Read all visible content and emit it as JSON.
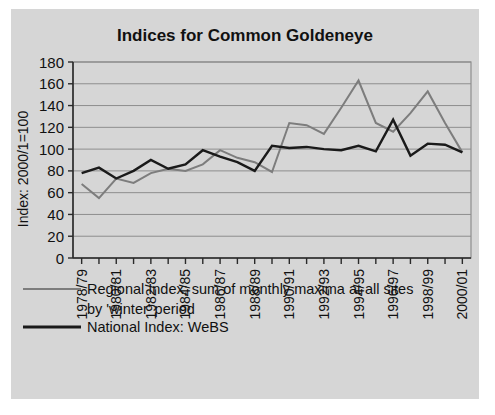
{
  "figure": {
    "background_color": "#d6d6d6",
    "page_background_color": "#ffffff"
  },
  "chart_data": {
    "type": "line",
    "title": "Indices for Common Goldeneye",
    "xlabel": "",
    "ylabel": "Index: 2000/1=100",
    "ylim": [
      0,
      180
    ],
    "ytick_step": 20,
    "yticks": [
      0,
      20,
      40,
      60,
      80,
      100,
      120,
      140,
      160,
      180
    ],
    "grid": true,
    "legend_position": "below",
    "x": [
      "1978/79",
      "1979/80",
      "1980/81",
      "1981/82",
      "1982/83",
      "1983/84",
      "1984/85",
      "1985/86",
      "1986/87",
      "1987/88",
      "1988/89",
      "1989/90",
      "1990/91",
      "1991/92",
      "1992/93",
      "1993/94",
      "1994/95",
      "1995/96",
      "1996/97",
      "1997/98",
      "1998/99",
      "1999/00",
      "2000/01"
    ],
    "xtick_labels_shown": [
      "1978/79",
      "1980/81",
      "1982/83",
      "1984/85",
      "1986/87",
      "1988/89",
      "1990/91",
      "1992/93",
      "1994/95",
      "1996/97",
      "1998/99",
      "2000/01"
    ],
    "series": [
      {
        "name": "Regional Index; sum of monthly maxima at all sites by 'winter' period",
        "color": "#7d7d7d",
        "values": [
          68,
          55,
          73,
          69,
          78,
          82,
          80,
          86,
          99,
          92,
          88,
          79,
          124,
          122,
          114,
          138,
          163,
          124,
          116,
          133,
          153,
          124,
          97
        ]
      },
      {
        "name": "National Index: WeBS",
        "color": "#1a1a1a",
        "values": [
          78,
          83,
          73,
          80,
          90,
          82,
          86,
          99,
          93,
          88,
          80,
          103,
          101,
          102,
          100,
          99,
          103,
          98,
          127,
          94,
          105,
          104,
          97
        ]
      }
    ]
  },
  "legend": {
    "entries": [
      {
        "swatch": "regional-line-swatch",
        "line1": "Regional Index; sum of monthly maxima at all sites",
        "line2": "by 'winter' period",
        "color": "#7d7d7d"
      },
      {
        "swatch": "national-line-swatch",
        "line1": "National Index: WeBS",
        "line2": "",
        "color": "#1a1a1a"
      }
    ]
  }
}
